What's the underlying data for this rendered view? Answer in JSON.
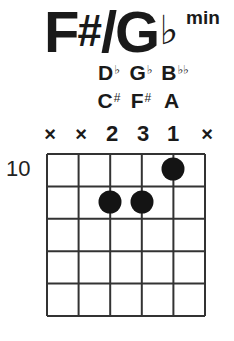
{
  "chord": {
    "root": "F",
    "root_accidental": "#",
    "separator": "/",
    "enharmonic_root": "G",
    "enharmonic_accidental": "♭",
    "quality": "min"
  },
  "notes": {
    "flat_spelling": [
      {
        "letter": "D",
        "accidental": "♭",
        "string": 3
      },
      {
        "letter": "G",
        "accidental": "♭",
        "string": 4
      },
      {
        "letter": "B",
        "accidental": "♭♭",
        "string": 5
      }
    ],
    "sharp_spelling": [
      {
        "letter": "C",
        "accidental": "#",
        "string": 3
      },
      {
        "letter": "F",
        "accidental": "#",
        "string": 4
      },
      {
        "letter": "A",
        "accidental": "",
        "string": 5
      }
    ]
  },
  "string_markers": [
    "×",
    "×",
    "2",
    "3",
    "1",
    "×"
  ],
  "fret_label": "10",
  "diagram": {
    "strings": 6,
    "frets_shown": 5,
    "starting_fret": 10,
    "dots": [
      {
        "string": 5,
        "fret": 1,
        "finger": 1
      },
      {
        "string": 3,
        "fret": 2,
        "finger": 2
      },
      {
        "string": 4,
        "fret": 2,
        "finger": 3
      }
    ],
    "line_color": "#333333",
    "dot_color": "#141414"
  }
}
